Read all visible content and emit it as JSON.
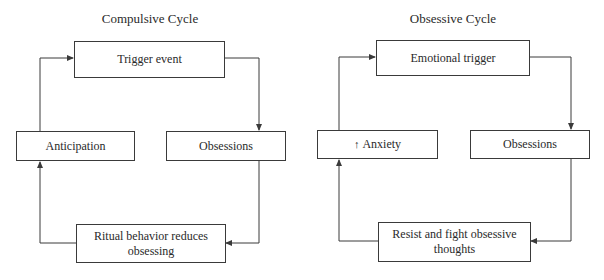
{
  "diagrams": [
    {
      "title": "Compulsive Cycle",
      "nodes": {
        "top": "Trigger event",
        "left": "Anticipation",
        "right": "Obsessions",
        "bottom": "Ritual behavior reduces obsessing"
      }
    },
    {
      "title": "Obsessive Cycle",
      "nodes": {
        "top": "Emotional trigger",
        "left_prefix_icon": "up-arrow-icon",
        "left_prefix": "↑",
        "left": "Anxiety",
        "right": "Obsessions",
        "bottom": "Resist and fight obsessive thoughts"
      }
    }
  ],
  "colors": {
    "line": "#3a3a3a",
    "text": "#2a2a2a",
    "background": "#ffffff"
  }
}
